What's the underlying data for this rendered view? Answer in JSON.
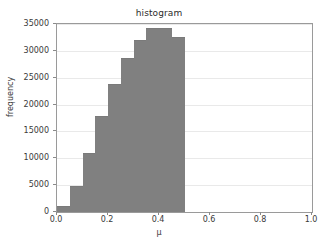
{
  "chart_data": {
    "type": "bar",
    "title": "histogram",
    "xlabel": "μ",
    "ylabel": "frequency",
    "xlim": [
      0.0,
      1.0
    ],
    "ylim": [
      0,
      35000
    ],
    "grid": true,
    "legend": null,
    "bar_color": "#808080",
    "bin_width": 0.05,
    "categories": [
      "0.00",
      "0.05",
      "0.10",
      "0.15",
      "0.20",
      "0.25",
      "0.30",
      "0.35",
      "0.40",
      "0.45"
    ],
    "bin_edges": [
      0.0,
      0.05,
      0.1,
      0.15,
      0.2,
      0.25,
      0.3,
      0.35,
      0.4,
      0.45,
      0.5
    ],
    "values": [
      1200,
      4800,
      11000,
      17800,
      23900,
      28600,
      32000,
      34200,
      34200,
      32500
    ],
    "xticks": [
      {
        "value": 0.0,
        "label": "0.0"
      },
      {
        "value": 0.2,
        "label": "0.2"
      },
      {
        "value": 0.4,
        "label": "0.4"
      },
      {
        "value": 0.6,
        "label": "0.6"
      },
      {
        "value": 0.8,
        "label": "0.8"
      },
      {
        "value": 1.0,
        "label": "1.0"
      }
    ],
    "yticks": [
      {
        "value": 0,
        "label": "0"
      },
      {
        "value": 5000,
        "label": "5000"
      },
      {
        "value": 10000,
        "label": "10000"
      },
      {
        "value": 15000,
        "label": "15000"
      },
      {
        "value": 20000,
        "label": "20000"
      },
      {
        "value": 25000,
        "label": "25000"
      },
      {
        "value": 30000,
        "label": "30000"
      },
      {
        "value": 35000,
        "label": "35000"
      }
    ]
  }
}
